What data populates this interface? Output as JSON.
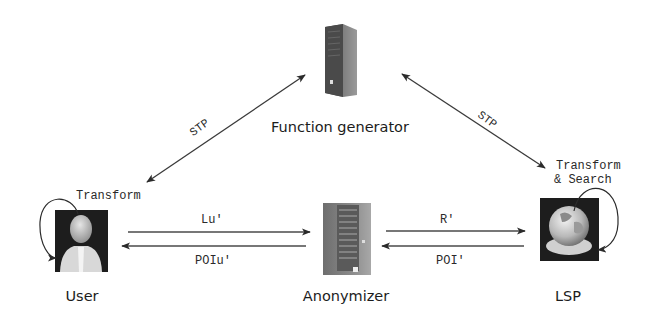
{
  "diagram": {
    "nodes": {
      "function_generator": {
        "label": "Function generator",
        "icon": "server-tower-icon"
      },
      "user": {
        "label": "User",
        "icon": "user-avatar-icon",
        "self_loop_label": "Transform"
      },
      "anonymizer": {
        "label": "Anonymizer",
        "icon": "server-rack-icon"
      },
      "lsp": {
        "label": "LSP",
        "icon": "globe-icon",
        "self_loop_label_line1": "Transform",
        "self_loop_label_line2": "& Search"
      }
    },
    "edges": {
      "user_fg": {
        "label": "STP",
        "direction": "bidirectional"
      },
      "fg_lsp": {
        "label": "STP",
        "direction": "bidirectional"
      },
      "user_to_anonymizer": {
        "label": "Lu'"
      },
      "anonymizer_to_user": {
        "label": "POIu'"
      },
      "anonymizer_to_lsp": {
        "label": "R'"
      },
      "lsp_to_anonymizer": {
        "label": "POI'"
      }
    }
  }
}
